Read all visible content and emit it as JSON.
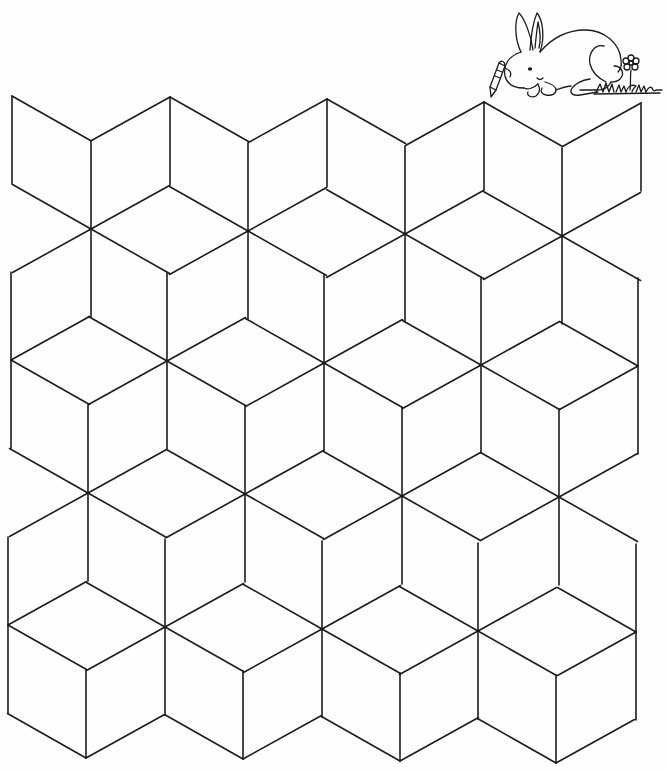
{
  "page": {
    "type": "coloring-page",
    "title": "Tumbling blocks coloring pattern",
    "background": "#ffffff",
    "line_color": "#1c1c1c"
  },
  "illustration": {
    "name": "rabbit-with-crayon",
    "elements": [
      "rabbit",
      "crayon",
      "flower",
      "grass"
    ]
  },
  "tiling": {
    "pattern": "tumbling-blocks",
    "edge_vectors": {
      "up": [
        0,
        -88
      ],
      "down": [
        0,
        88
      ],
      "ur": [
        78.5,
        -43.5
      ],
      "ul": [
        -78.5,
        -44.5
      ],
      "dr": [
        78.5,
        44.5
      ],
      "dl": [
        -78.5,
        43.5
      ]
    },
    "rows": [
      {
        "name": "Z",
        "stars": [
          {
            "x": 12,
            "y": 96,
            "edges": [
              "down",
              "dr"
            ]
          },
          {
            "x": 170,
            "y": 97,
            "edges": [
              "dl",
              "down",
              "dr"
            ]
          },
          {
            "x": 327,
            "y": 99,
            "edges": [
              "dl",
              "down",
              "dr"
            ]
          },
          {
            "x": 484,
            "y": 102,
            "edges": [
              "dl",
              "down",
              "dr"
            ]
          },
          {
            "x": 641,
            "y": 103,
            "edges": [
              "dl",
              "down"
            ]
          }
        ]
      },
      {
        "name": "A",
        "stars": [
          {
            "x": 91,
            "y": 229,
            "edges": [
              "up",
              "ur",
              "dr",
              "down",
              "dl",
              "ul"
            ]
          },
          {
            "x": 248,
            "y": 231,
            "edges": [
              "up",
              "ur",
              "dr",
              "down",
              "dl",
              "ul"
            ]
          },
          {
            "x": 405,
            "y": 234,
            "edges": [
              "up",
              "ur",
              "dr",
              "down",
              "dl",
              "ul"
            ]
          },
          {
            "x": 562,
            "y": 236,
            "edges": [
              "up",
              "ur",
              "dr",
              "down",
              "dl",
              "ul"
            ]
          }
        ]
      },
      {
        "name": "B",
        "stars": [
          {
            "x": 11,
            "y": 360,
            "edges": [
              "up",
              "ur",
              "dr",
              "down"
            ]
          },
          {
            "x": 167,
            "y": 361,
            "edges": [
              "up",
              "ur",
              "dr",
              "down",
              "dl",
              "ul"
            ]
          },
          {
            "x": 324,
            "y": 363,
            "edges": [
              "up",
              "ur",
              "dr",
              "down",
              "dl",
              "ul"
            ]
          },
          {
            "x": 481,
            "y": 365,
            "edges": [
              "up",
              "ur",
              "dr",
              "down",
              "dl",
              "ul"
            ]
          },
          {
            "x": 638,
            "y": 366,
            "edges": [
              "up",
              "down",
              "dl",
              "ul"
            ]
          }
        ]
      },
      {
        "name": "C",
        "stars": [
          {
            "x": 88,
            "y": 493,
            "edges": [
              "up",
              "ur",
              "dr",
              "down",
              "dl",
              "ul"
            ]
          },
          {
            "x": 245,
            "y": 494,
            "edges": [
              "up",
              "ur",
              "dr",
              "down",
              "dl",
              "ul"
            ]
          },
          {
            "x": 402,
            "y": 496,
            "edges": [
              "up",
              "ur",
              "dr",
              "down",
              "dl",
              "ul"
            ]
          },
          {
            "x": 559,
            "y": 497,
            "edges": [
              "up",
              "ur",
              "dr",
              "down",
              "dl",
              "ul"
            ]
          }
        ]
      },
      {
        "name": "D",
        "stars": [
          {
            "x": 8,
            "y": 625,
            "edges": [
              "up",
              "ur",
              "dr",
              "down"
            ]
          },
          {
            "x": 165,
            "y": 627,
            "edges": [
              "up",
              "ur",
              "dr",
              "down",
              "dl",
              "ul"
            ]
          },
          {
            "x": 322,
            "y": 629,
            "edges": [
              "up",
              "ur",
              "dr",
              "down",
              "dl",
              "ul"
            ]
          },
          {
            "x": 478,
            "y": 631,
            "edges": [
              "up",
              "ur",
              "dr",
              "down",
              "dl",
              "ul"
            ]
          },
          {
            "x": 636,
            "y": 632,
            "edges": [
              "up",
              "down",
              "dl",
              "ul"
            ]
          }
        ]
      },
      {
        "name": "E",
        "stars": [
          {
            "x": 86,
            "y": 758,
            "edges": [
              "up",
              "ur",
              "ul"
            ]
          },
          {
            "x": 243,
            "y": 759,
            "edges": [
              "up",
              "ur",
              "ul"
            ]
          },
          {
            "x": 400,
            "y": 761,
            "edges": [
              "up",
              "ur",
              "ul"
            ]
          },
          {
            "x": 556,
            "y": 763,
            "edges": [
              "up",
              "ur",
              "ul"
            ]
          }
        ]
      }
    ]
  }
}
